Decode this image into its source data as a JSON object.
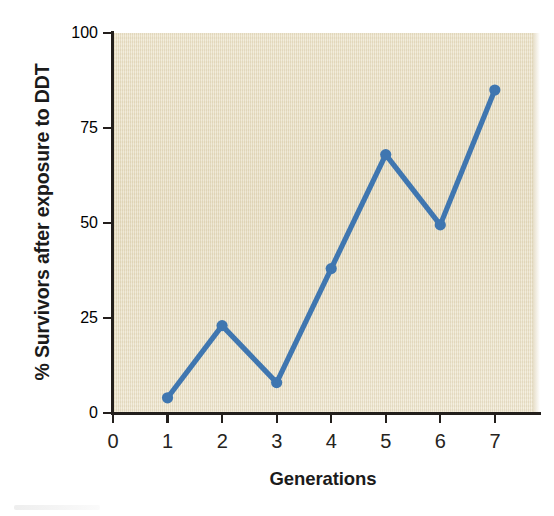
{
  "chart_data": {
    "type": "line",
    "title": "",
    "xlabel": "Generations",
    "ylabel": "% Survivors after exposure to DDT",
    "x": [
      1,
      2,
      3,
      4,
      5,
      6,
      7
    ],
    "values": [
      4,
      23,
      8,
      38,
      68,
      49.5,
      85
    ],
    "series": [
      {
        "name": "% Survivors after exposure to DDT",
        "values": [
          4,
          23,
          8,
          38,
          68,
          49.5,
          85
        ]
      }
    ],
    "xlim": [
      0,
      7.7
    ],
    "ylim": [
      0,
      100
    ],
    "x_ticks": [
      "0",
      "1",
      "2",
      "3",
      "4",
      "5",
      "6",
      "7"
    ],
    "x_tick_values": [
      0,
      1,
      2,
      3,
      4,
      5,
      6,
      7
    ],
    "y_ticks": [
      "0",
      "25",
      "50",
      "75",
      "100"
    ],
    "y_tick_values": [
      0,
      25,
      50,
      75,
      100
    ],
    "grid": false,
    "legend": false,
    "legend_position": "none",
    "markers": "filled-circle",
    "colors": {
      "line": "#3f76b0",
      "marker": "#3f76b0",
      "plot_background": "#e9dfc3",
      "axis": "#231f1c",
      "text": "#1b1b1b",
      "page_background": "#ffffff"
    }
  },
  "axis": {
    "y_title": "% Survivors after exposure to DDT",
    "x_title": "Generations"
  }
}
